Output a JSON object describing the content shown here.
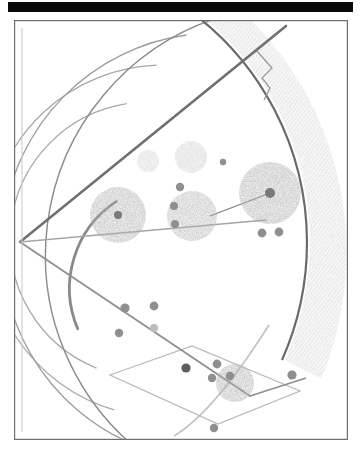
{
  "page": {
    "width": 361,
    "height": 455,
    "background_color": "#ffffff"
  },
  "top_bar": {
    "name": "black-header-bar",
    "color": "#0a0a0a",
    "x": 8,
    "y": 2,
    "width": 345,
    "height": 10
  },
  "frame": {
    "name": "figure-border",
    "stroke_color": "#6e6e6e",
    "fill_color": "#ffffff",
    "x": 14,
    "y": 20,
    "width": 334,
    "height": 420
  },
  "colors": {
    "dark_line": "#6f6f6f",
    "mid_line": "#9a9a9a",
    "light_line": "#b9b9b9",
    "hatch_dark": "#8c8c8c",
    "blob_fill": "#b0b0b0",
    "blob_light": "#cfcfcf",
    "dot_fill": "#8f8f8f",
    "frame_stroke": "#6e6e6e"
  },
  "chart_data": {
    "type": "diagram",
    "vertex": {
      "x": 6,
      "y": 222
    },
    "rays": [
      {
        "name": "ray-upper",
        "x1": 6,
        "y1": 222,
        "x2": 268,
        "y2": 10,
        "stroke": "#6f6f6f",
        "width": 2.6
      },
      {
        "name": "ray-middle",
        "x1": 6,
        "y1": 222,
        "x2": 250,
        "y2": 200,
        "stroke": "#a5a5a5",
        "width": 1.7
      },
      {
        "name": "ray-lower",
        "x1": 6,
        "y1": 222,
        "x2": 232,
        "y2": 373,
        "stroke": "#8f8f8f",
        "width": 1.8
      }
    ],
    "arcs": [
      {
        "name": "arc-1-innermost",
        "radius": 104,
        "stroke": "#8a8a8a",
        "width": 2.8
      },
      {
        "name": "arc-2",
        "radius": 138,
        "stroke": "#a8a8a8",
        "width": 1.3
      },
      {
        "name": "arc-3",
        "radius": 176,
        "stroke": "#a8a8a8",
        "width": 1.3
      },
      {
        "name": "arc-4",
        "radius": 214,
        "stroke": "#9c9c9c",
        "width": 1.3
      },
      {
        "name": "arc-5",
        "radius": 250,
        "stroke": "#8a8a8a",
        "width": 1.4
      },
      {
        "name": "arc-6-outer-boundary",
        "radius": 288,
        "stroke": "#6a6a6a",
        "width": 2.2
      }
    ],
    "hatched_region": {
      "name": "hatched-crescent",
      "inner_radius": 290,
      "outer_radius": 330,
      "angle_start_deg": -78,
      "angle_end_deg": 24,
      "fill": "#8c8c8c",
      "opacity": 0.58
    },
    "blobs": [
      {
        "name": "blob-large-right",
        "cx": 256,
        "cy": 173,
        "r": 31,
        "fill": "#b0b0b0",
        "opacity": 0.85,
        "has_core_dot": true,
        "core_r": 5
      },
      {
        "name": "blob-mid-left",
        "cx": 104,
        "cy": 195,
        "r": 28,
        "fill": "#b2b2b2",
        "opacity": 0.85,
        "has_core_dot": true,
        "core_r": 4
      },
      {
        "name": "blob-mid-center",
        "cx": 178,
        "cy": 196,
        "r": 25,
        "fill": "#b4b4b4",
        "opacity": 0.8,
        "has_core_dot": false,
        "core_r": 0
      },
      {
        "name": "blob-bottom",
        "cx": 221,
        "cy": 363,
        "r": 19,
        "fill": "#b0b0b0",
        "opacity": 0.85,
        "has_core_dot": false,
        "core_r": 0
      },
      {
        "name": "blob-faint-upper-small",
        "cx": 134,
        "cy": 141,
        "r": 11,
        "fill": "#cfcfcf",
        "opacity": 0.7,
        "has_core_dot": false,
        "core_r": 0
      },
      {
        "name": "blob-faint-upper-large",
        "cx": 177,
        "cy": 137,
        "r": 16,
        "fill": "#c8c8c8",
        "opacity": 0.7,
        "has_core_dot": false,
        "core_r": 0
      }
    ],
    "nodes": [
      {
        "name": "node-upper-right-small",
        "cx": 209,
        "cy": 142,
        "r": 3.2
      },
      {
        "name": "node-blob-edge-a",
        "cx": 166,
        "cy": 167,
        "r": 4.2
      },
      {
        "name": "node-blob-edge-b",
        "cx": 160,
        "cy": 186,
        "r": 4.0
      },
      {
        "name": "node-blob-edge-c",
        "cx": 161,
        "cy": 204,
        "r": 4.0
      },
      {
        "name": "node-right-pair-a",
        "cx": 248,
        "cy": 213,
        "r": 4.4
      },
      {
        "name": "node-right-pair-b",
        "cx": 265,
        "cy": 212,
        "r": 4.4
      },
      {
        "name": "node-lower-left-a",
        "cx": 111,
        "cy": 288,
        "r": 4.6
      },
      {
        "name": "node-lower-left-b",
        "cx": 105,
        "cy": 313,
        "r": 4.2
      },
      {
        "name": "node-lower-mid-a",
        "cx": 140,
        "cy": 286,
        "r": 4.4
      },
      {
        "name": "node-lower-mid-b",
        "cx": 140,
        "cy": 308,
        "r": 4.0
      },
      {
        "name": "node-quad-corner-top",
        "cx": 172,
        "cy": 348,
        "r": 4.6
      },
      {
        "name": "node-quad-vertex-left",
        "cx": 172,
        "cy": 348,
        "r": 3.0
      },
      {
        "name": "node-quad-a",
        "cx": 203,
        "cy": 344,
        "r": 4.4
      },
      {
        "name": "node-quad-b",
        "cx": 198,
        "cy": 358,
        "r": 4.2
      },
      {
        "name": "node-quad-c",
        "cx": 216,
        "cy": 356,
        "r": 4.2
      },
      {
        "name": "node-quad-right",
        "cx": 278,
        "cy": 355,
        "r": 4.6
      },
      {
        "name": "node-bottom-stray",
        "cx": 200,
        "cy": 408,
        "r": 4.2
      }
    ],
    "quadrilateral": {
      "name": "tilted-quadrilateral",
      "points": "96,355 178,326 286,371 204,404",
      "stroke": "#b9b9b9",
      "width": 1.2
    },
    "notch": {
      "name": "stepped-notch",
      "points": "248,36 262,52 252,62 258,72",
      "stroke": "#9a9a9a",
      "width": 1.3
    }
  }
}
